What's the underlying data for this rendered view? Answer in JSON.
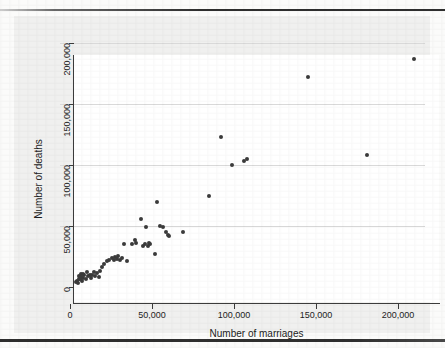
{
  "chart_data": {
    "type": "scatter",
    "title": "",
    "xlabel": "Number of marriages",
    "ylabel": "Number of deaths",
    "xlim": [
      0,
      215000
    ],
    "ylim": [
      0,
      205000
    ],
    "xticks": [
      0,
      50000,
      100000,
      150000,
      200000
    ],
    "yticks": [
      0,
      50000,
      100000,
      150000,
      200000
    ],
    "xtick_labels": [
      "0",
      "50,000",
      "100,000",
      "150,000",
      "200,000"
    ],
    "ytick_labels": [
      "0",
      "50,000",
      "100,000",
      "150,000",
      "200,000"
    ],
    "grid": "horizontal",
    "legend": "none",
    "marker_color": "#3b3b3b",
    "points": [
      [
        3500,
        4000
      ],
      [
        4200,
        5200
      ],
      [
        4800,
        3200
      ],
      [
        5200,
        7000
      ],
      [
        5600,
        9000
      ],
      [
        6000,
        6200
      ],
      [
        6400,
        10500
      ],
      [
        6800,
        8200
      ],
      [
        7200,
        5000
      ],
      [
        7600,
        11000
      ],
      [
        8200,
        7500
      ],
      [
        8800,
        9500
      ],
      [
        9600,
        6800
      ],
      [
        10200,
        12000
      ],
      [
        11000,
        8800
      ],
      [
        12000,
        10000
      ],
      [
        12800,
        7200
      ],
      [
        13600,
        9800
      ],
      [
        14500,
        12500
      ],
      [
        15500,
        9200
      ],
      [
        16500,
        11500
      ],
      [
        17500,
        8500
      ],
      [
        18500,
        13500
      ],
      [
        19500,
        16500
      ],
      [
        21000,
        18500
      ],
      [
        22500,
        21000
      ],
      [
        24000,
        22000
      ],
      [
        25500,
        23500
      ],
      [
        26500,
        22500
      ],
      [
        27500,
        24500
      ],
      [
        28500,
        23000
      ],
      [
        29500,
        25500
      ],
      [
        30500,
        22000
      ],
      [
        31500,
        24000
      ],
      [
        33000,
        35500
      ],
      [
        34500,
        21000
      ],
      [
        37500,
        35000
      ],
      [
        39500,
        38500
      ],
      [
        40500,
        36000
      ],
      [
        43500,
        56000
      ],
      [
        44500,
        33500
      ],
      [
        45500,
        35500
      ],
      [
        46500,
        49500
      ],
      [
        47500,
        34000
      ],
      [
        48000,
        36500
      ],
      [
        49000,
        35500
      ],
      [
        51500,
        27000
      ],
      [
        53000,
        70000
      ],
      [
        55000,
        50000
      ],
      [
        56500,
        49000
      ],
      [
        58500,
        45000
      ],
      [
        59500,
        43000
      ],
      [
        60500,
        42000
      ],
      [
        69000,
        45000
      ],
      [
        85000,
        75000
      ],
      [
        92000,
        123000
      ],
      [
        99000,
        100000
      ],
      [
        106000,
        103500
      ],
      [
        108000,
        105000
      ],
      [
        145000,
        172000
      ],
      [
        181000,
        108000
      ],
      [
        210000,
        187000
      ]
    ]
  },
  "axes": {
    "x_title": "Number of marriages",
    "y_title": "Number of deaths"
  }
}
